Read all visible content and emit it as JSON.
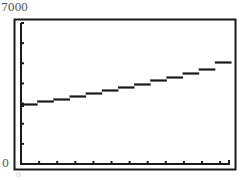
{
  "chart_data": {
    "type": "line",
    "title": "",
    "xlabel": "",
    "ylabel": "",
    "ylim": [
      0,
      7000
    ],
    "y_tick_labels": [
      "0",
      "7000"
    ],
    "y_ticks": [
      0,
      1000,
      2000,
      3000,
      4000,
      5000,
      6000,
      7000
    ],
    "x_tick_count": 11,
    "x_tick_label_partial": "0",
    "grid": false,
    "legend": null,
    "style": "graphing-calculator step-rendered curve",
    "series": [
      {
        "name": "f(x)",
        "x_index": [
          0,
          1,
          2,
          3,
          4,
          5,
          6,
          7,
          8,
          9,
          10,
          11
        ],
        "values": [
          3000,
          3120,
          3250,
          3380,
          3520,
          3670,
          3820,
          3990,
          4160,
          4340,
          4530,
          4720,
          5050
        ]
      }
    ],
    "colors": {
      "line": "#1a1a1a",
      "frame": "#1a1a1a",
      "background": "#ffffff"
    }
  },
  "labels": {
    "ymax": "7000",
    "ymin": "0",
    "xmin": "0"
  }
}
